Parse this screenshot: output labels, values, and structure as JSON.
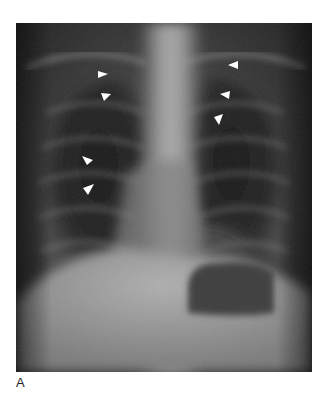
{
  "figure": {
    "panel_label": "A",
    "content": "Frontal (PA) chest radiograph",
    "annotations": {
      "arrowhead_color": "#ffffff",
      "arrowheads": [
        {
          "side": "left-lung",
          "x": 102,
          "y": 74,
          "direction": "right"
        },
        {
          "side": "left-lung",
          "x": 105,
          "y": 96,
          "direction": "right"
        },
        {
          "side": "left-lung",
          "x": 90,
          "y": 160,
          "direction": "down-right"
        },
        {
          "side": "left-lung",
          "x": 87,
          "y": 190,
          "direction": "up-right"
        },
        {
          "side": "right-lung",
          "x": 232,
          "y": 64,
          "direction": "left"
        },
        {
          "side": "right-lung",
          "x": 224,
          "y": 94,
          "direction": "left"
        },
        {
          "side": "right-lung",
          "x": 216,
          "y": 117,
          "direction": "down-left"
        }
      ]
    }
  }
}
